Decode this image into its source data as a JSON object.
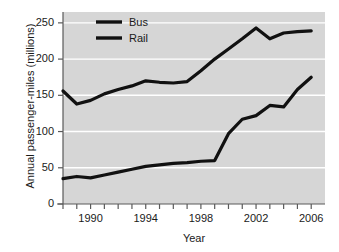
{
  "chart_data": {
    "type": "line",
    "title": "",
    "xlabel": "Year",
    "ylabel": "Annual passenger-miles (millions)",
    "xlim": [
      1988,
      2007
    ],
    "ylim": [
      0,
      265
    ],
    "yticks": [
      0,
      50,
      100,
      150,
      200,
      250
    ],
    "ytick_labels": [
      "0",
      "50",
      "100",
      "150",
      "200",
      "250"
    ],
    "xticks": [
      1988,
      1989,
      1990,
      1991,
      1992,
      1993,
      1994,
      1995,
      1996,
      1997,
      1998,
      1999,
      2000,
      2001,
      2002,
      2003,
      2004,
      2005,
      2006
    ],
    "xtick_labels": [
      "",
      "",
      "1990",
      "",
      "",
      "",
      "1994",
      "",
      "",
      "",
      "1998",
      "",
      "",
      "",
      "2002",
      "",
      "",
      "",
      "2006"
    ],
    "grid": true,
    "grid_color": "#ffffff",
    "plot_background": "#d6d6d6",
    "legend_position": "top-center",
    "x": [
      1988,
      1989,
      1990,
      1991,
      1992,
      1993,
      1994,
      1995,
      1996,
      1997,
      1998,
      1999,
      2000,
      2001,
      2002,
      2003,
      2004,
      2005,
      2006
    ],
    "series": [
      {
        "name": "Bus",
        "color": "#111111",
        "values": [
          156,
          138,
          143,
          152,
          158,
          163,
          170,
          168,
          167,
          169,
          184,
          200,
          214,
          228,
          243,
          228,
          236,
          238,
          239
        ]
      },
      {
        "name": "Rail",
        "color": "#111111",
        "values": [
          35,
          38,
          36,
          40,
          44,
          48,
          52,
          54,
          56,
          57,
          59,
          60,
          97,
          117,
          122,
          136,
          134,
          158,
          175
        ]
      }
    ]
  },
  "legend": {
    "entries": [
      {
        "label": "Bus"
      },
      {
        "label": "Rail"
      }
    ]
  }
}
